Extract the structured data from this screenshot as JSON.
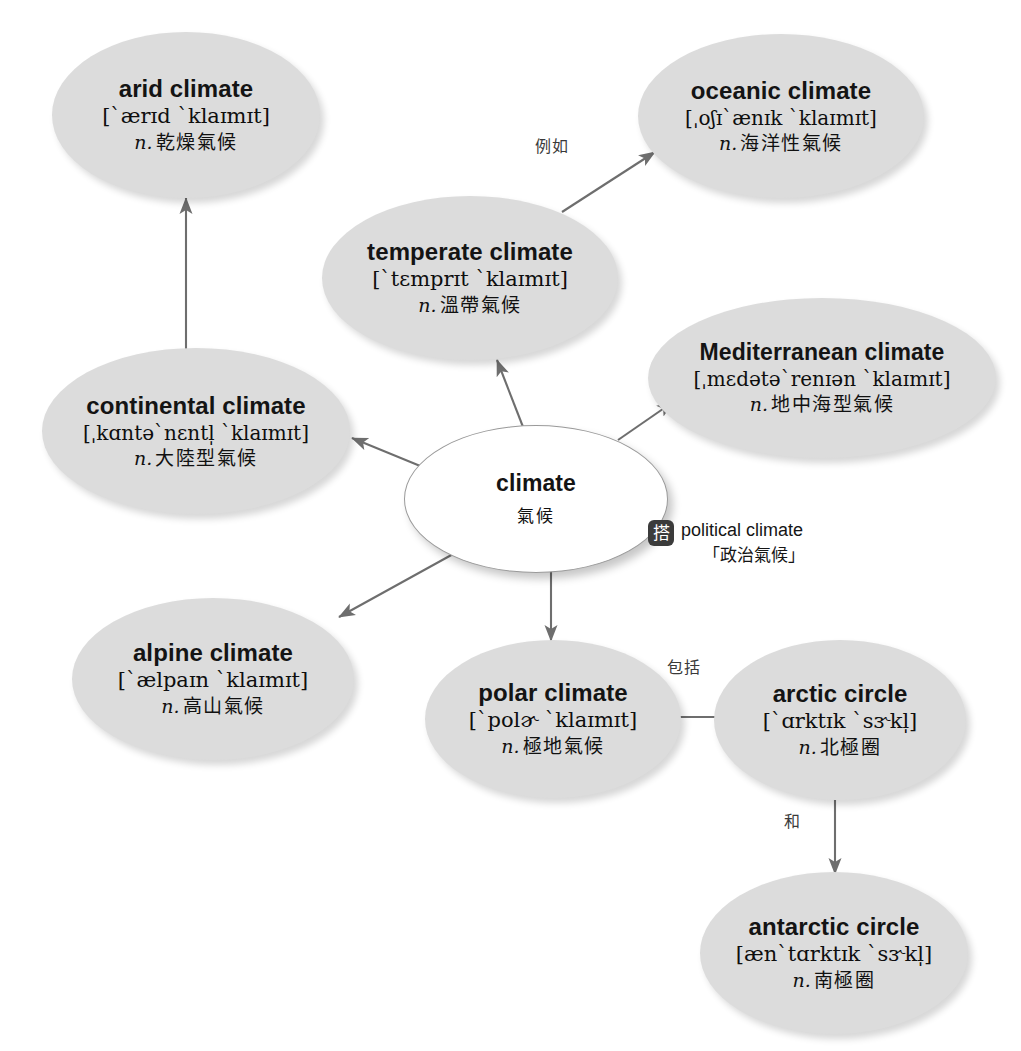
{
  "diagram": {
    "accent_color": "#dcdcdc",
    "edge_color": "#6e6e6e",
    "badge_color": "#3b3b3b"
  },
  "center": {
    "term": "climate",
    "gloss_cn": "氣候"
  },
  "nodes": [
    {
      "id": "arid",
      "term": "arid climate",
      "ipa": "[`ærɪd `klaɪmɪt]",
      "pos": "n.",
      "gloss_cn": "乾燥氣候"
    },
    {
      "id": "oceanic",
      "term": "oceanic climate",
      "ipa": "[ˌoʃɪ`ænɪk `klaɪmɪt]",
      "pos": "n.",
      "gloss_cn": "海洋性氣候"
    },
    {
      "id": "temperate",
      "term": "temperate climate",
      "ipa": "[`tɛmprɪt `klaɪmɪt]",
      "pos": "n.",
      "gloss_cn": "溫帶氣候"
    },
    {
      "id": "mediterranean",
      "term": "Mediterranean climate",
      "ipa": "[ˌmɛdətə`renɪən `klaɪmɪt]",
      "pos": "n.",
      "gloss_cn": "地中海型氣候"
    },
    {
      "id": "continental",
      "term": "continental climate",
      "ipa": "[ˌkɑntə`nɛntl̩ `klaɪmɪt]",
      "pos": "n.",
      "gloss_cn": "大陸型氣候"
    },
    {
      "id": "alpine",
      "term": "alpine climate",
      "ipa": "[`ælpaɪn `klaɪmɪt]",
      "pos": "n.",
      "gloss_cn": "高山氣候"
    },
    {
      "id": "polar",
      "term": "polar climate",
      "ipa": "[`polɚ `klaɪmɪt]",
      "pos": "n.",
      "gloss_cn": "極地氣候"
    },
    {
      "id": "arctic",
      "term": "arctic circle",
      "ipa": "[`ɑrktɪk `sɝkl̩]",
      "pos": "n.",
      "gloss_cn": "北極圈"
    },
    {
      "id": "antarctic",
      "term": "antarctic circle",
      "ipa": "[æn`tɑrktɪk `sɝkl̩]",
      "pos": "n.",
      "gloss_cn": "南極圈"
    }
  ],
  "edge_labels": {
    "temperate_to_oceanic": "例如",
    "polar_to_arctic": "包括",
    "arctic_to_antarctic": "和"
  },
  "collocation": {
    "badge": "搭",
    "english": "political climate",
    "chinese": "「政治氣候」"
  }
}
